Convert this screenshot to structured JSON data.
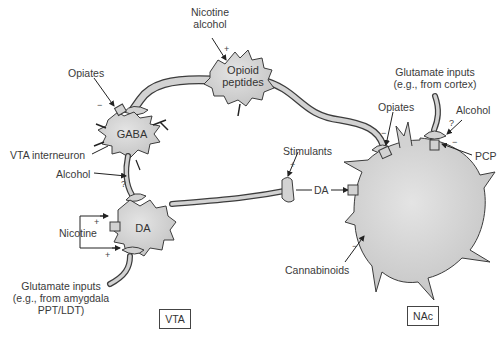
{
  "diagram": {
    "regions": {
      "vta": "VTA",
      "nac": "NAc"
    },
    "cells": {
      "gaba": "GABA",
      "da": "DA",
      "opioid_line1": "Opioid",
      "opioid_line2": "peptides"
    },
    "labels": {
      "nicotine_alcohol_line1": "Nicotine",
      "nicotine_alcohol_line2": "alcohol",
      "opiates_vta": "Opiates",
      "vta_interneuron": "VTA interneuron",
      "alcohol_vta": "Alcohol",
      "nicotine_vta": "Nicotine",
      "glutamate_vta_line1": "Glutamate inputs",
      "glutamate_vta_line2": "(e.g., from amygdala",
      "glutamate_vta_line3": "PPT/LDT)",
      "stimulants": "Stimulants",
      "da_projection": "DA",
      "glutamate_nac_line1": "Glutamate inputs",
      "glutamate_nac_line2": "(e.g., from cortex)",
      "opiates_nac": "Opiates",
      "alcohol_nac": "Alcohol",
      "pcp": "PCP",
      "cannabinoids": "Cannabinoids"
    },
    "signs": {
      "nicotine_alcohol": "+",
      "opiates_vta": "−",
      "alcohol_vta": "?",
      "nicotine_da": "+",
      "nicotine_glut": "+",
      "stimulants": "+",
      "opiates_nac": "−",
      "alcohol_nac_q": "?",
      "alcohol_nac": "−",
      "cannabinoids": "−"
    },
    "colors": {
      "cell_fill": "#d2d2d2",
      "outline": "#3c3c3c",
      "text": "#3a3a3a"
    }
  }
}
